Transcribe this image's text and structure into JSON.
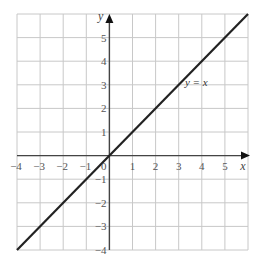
{
  "chart_data": {
    "type": "line",
    "title": "",
    "xlabel": "x",
    "ylabel": "y",
    "xlim": [
      -4,
      6
    ],
    "ylim": [
      -4,
      6
    ],
    "grid": true,
    "x_ticks": [
      -4,
      -3,
      -2,
      -1,
      0,
      1,
      2,
      3,
      4,
      5
    ],
    "y_ticks": [
      -4,
      -3,
      -2,
      -1,
      1,
      2,
      3,
      4,
      5
    ],
    "x_tick_labels": [
      "−4",
      "−3",
      "−2",
      "−1",
      "0",
      "1",
      "2",
      "3",
      "4",
      "5"
    ],
    "y_tick_labels": [
      "−4",
      "−3",
      "−2",
      "−1",
      "1",
      "2",
      "3",
      "4",
      "5"
    ],
    "series": [
      {
        "name": "y = x",
        "x": [
          -4,
          6
        ],
        "y": [
          -4,
          6
        ],
        "color": "#222222"
      }
    ],
    "annotations": [
      {
        "text": "y = x",
        "x": 3.4,
        "y": 3.1
      }
    ],
    "colors": {
      "grid": "#c8c8c8",
      "axis": "#444444",
      "line": "#222222"
    }
  }
}
